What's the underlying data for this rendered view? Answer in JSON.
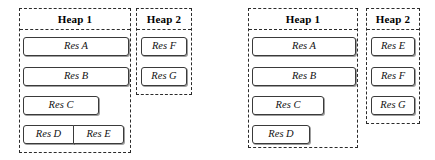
{
  "figure": {
    "type": "heap-allocation-diagram",
    "panel_count": 4,
    "style": {
      "panel_border": "dashed",
      "panel_border_color": "#2b2b2b",
      "block_border_color": "#3a3a3a",
      "background": "#ffffff",
      "text_color": "#111111"
    }
  },
  "diagrams": [
    {
      "id": "left",
      "panels": [
        {
          "id": "left-heap-1",
          "title": "Heap 1",
          "blocks": [
            {
              "rows": [
                {
                  "label": "Res A"
                }
              ]
            },
            {
              "rows": [
                {
                  "label": "Res B"
                }
              ]
            },
            {
              "rows": [
                {
                  "label": "Res C"
                }
              ]
            },
            {
              "rows": [
                {
                  "label": "Res D"
                },
                {
                  "label": "Res E"
                }
              ]
            }
          ]
        },
        {
          "id": "left-heap-2",
          "title": "Heap 2",
          "blocks": [
            {
              "rows": [
                {
                  "label": "Res F"
                }
              ]
            },
            {
              "rows": [
                {
                  "label": "Res G"
                }
              ]
            }
          ]
        }
      ]
    },
    {
      "id": "right",
      "panels": [
        {
          "id": "right-heap-1",
          "title": "Heap 1",
          "blocks": [
            {
              "rows": [
                {
                  "label": "Res A"
                }
              ]
            },
            {
              "rows": [
                {
                  "label": "Res B"
                }
              ]
            },
            {
              "rows": [
                {
                  "label": "Res C"
                }
              ]
            },
            {
              "rows": [
                {
                  "label": "Res D"
                }
              ]
            }
          ]
        },
        {
          "id": "right-heap-2",
          "title": "Heap 2",
          "blocks": [
            {
              "rows": [
                {
                  "label": "Res E"
                }
              ]
            },
            {
              "rows": [
                {
                  "label": "Res F"
                }
              ]
            },
            {
              "rows": [
                {
                  "label": "Res G"
                }
              ]
            }
          ]
        }
      ]
    }
  ],
  "labels": {
    "left_heap1_title": "Heap 1",
    "left_heap2_title": "Heap 2",
    "right_heap1_title": "Heap 1",
    "right_heap2_title": "Heap 2",
    "left_heap1_res_a": "Res A",
    "left_heap1_res_b": "Res B",
    "left_heap1_res_c": "Res C",
    "left_heap1_res_d": "Res D",
    "left_heap1_res_e": "Res E",
    "left_heap2_res_f": "Res F",
    "left_heap2_res_g": "Res G",
    "right_heap1_res_a": "Res A",
    "right_heap1_res_b": "Res B",
    "right_heap1_res_c": "Res C",
    "right_heap1_res_d": "Res D",
    "right_heap2_res_e": "Res E",
    "right_heap2_res_f": "Res F",
    "right_heap2_res_g": "Res G"
  }
}
